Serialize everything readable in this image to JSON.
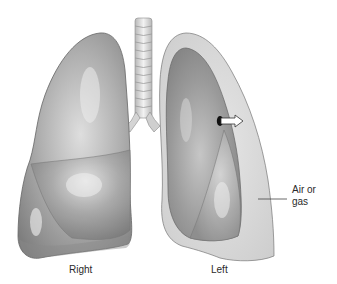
{
  "diagram": {
    "labels": {
      "right_lung": "Right",
      "left_lung": "Left",
      "air_line1": "Air or",
      "air_line2": "gas"
    },
    "colors": {
      "background": "#ffffff",
      "lung_mid": "#a8a8a8",
      "lung_dark": "#7a7a7a",
      "lung_light": "#d8d8d8",
      "pleural_air": "#dcdcdc",
      "outline": "#6a6a6a",
      "trachea": "#e6e6e6",
      "text": "#2a2a2a"
    }
  }
}
